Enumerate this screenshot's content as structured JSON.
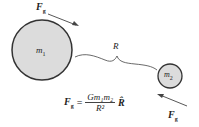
{
  "diagram": {
    "mass1_label": "m",
    "mass1_sub": "1",
    "mass2_label": "m",
    "mass2_sub": "2",
    "distance_label": "R",
    "force_label": "F",
    "force_sub": "g",
    "equation": {
      "lhs": "F",
      "lhs_sub": "g",
      "equals": "=",
      "numerator": "Gm₁m₂",
      "denominator": "R²",
      "unit_vector": "R̂"
    },
    "colors": {
      "fill": "#dcdcdc",
      "stroke": "#333333"
    }
  }
}
